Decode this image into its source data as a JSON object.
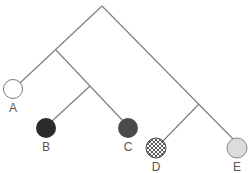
{
  "diagram": {
    "type": "cladogram",
    "line_color": "#808080",
    "leaves": [
      {
        "label": "A",
        "fill": "white",
        "fill_color": "#ffffff"
      },
      {
        "label": "B",
        "fill": "black",
        "fill_color": "#2b2b2b"
      },
      {
        "label": "C",
        "fill": "dark-gray",
        "fill_color": "#4a4a4a"
      },
      {
        "label": "D",
        "fill": "crosshatch",
        "fill_color": "#444444"
      },
      {
        "label": "E",
        "fill": "light-gray",
        "fill_color": "#dcdcdc"
      }
    ],
    "topology": "((A,(B,C)),(D,E))"
  }
}
